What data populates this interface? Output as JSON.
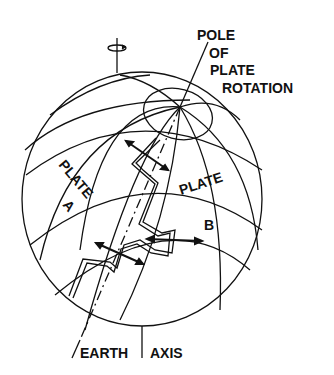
{
  "diagram": {
    "pole_label": [
      "POLE",
      "OF",
      "PLATE",
      "ROTATION"
    ],
    "plate_a": {
      "line1": "PLATE",
      "line2": "A"
    },
    "plate_b": {
      "line1": "PLATE",
      "line2": "B"
    },
    "earth_axis": {
      "word1": "EARTH",
      "word2": "AXIS"
    },
    "colors": {
      "ink": "#111111",
      "background": "#ffffff"
    },
    "icons": [
      "rotation-arrow-icon",
      "double-arrow-icon"
    ]
  }
}
